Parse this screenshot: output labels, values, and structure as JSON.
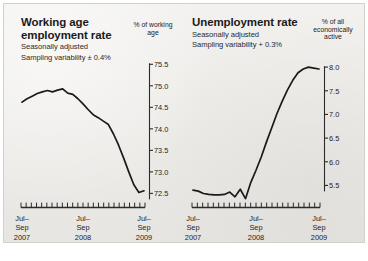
{
  "figure": {
    "background_color": "#eceae6",
    "line_color": "#1a1a1a"
  },
  "chart_data": [
    {
      "type": "line",
      "title": "Working age employment rate",
      "subtitle_1": "Seasonally adjusted",
      "subtitle_2": "Sampling variability ± 0.4%",
      "ylabel": "% of working age",
      "xlabel": "",
      "ylim": [
        72.3,
        75.6
      ],
      "yticks": [
        75.5,
        75.0,
        74.5,
        74.0,
        73.5,
        73.0,
        72.5
      ],
      "ytick_labels": [
        "75.5",
        "75.0",
        "74.5",
        "74.0",
        "73.5",
        "73.0",
        "72.5"
      ],
      "xtick_labels": [
        "Jul–Sep 2007",
        "Jul–Sep 2008",
        "Jul–Sep 2009"
      ],
      "xtick_lines": [
        [
          "Jul–",
          "Sep",
          "2007"
        ],
        [
          "Jul–",
          "Sep",
          "2008"
        ],
        [
          "Jul–",
          "Sep",
          "2009"
        ]
      ],
      "grid": false,
      "legend": "none",
      "n_minor_ticks": 25,
      "x": [
        0,
        1,
        2,
        3,
        4,
        5,
        6,
        7,
        8,
        9,
        10,
        11,
        12,
        13,
        14,
        15,
        16,
        17,
        18,
        19,
        20,
        21,
        22,
        23,
        24
      ],
      "values": [
        74.62,
        74.7,
        74.76,
        74.82,
        74.86,
        74.89,
        74.86,
        74.9,
        74.93,
        74.83,
        74.8,
        74.7,
        74.58,
        74.45,
        74.33,
        74.26,
        74.18,
        74.1,
        73.88,
        73.62,
        73.32,
        73.0,
        72.7,
        72.52,
        72.56
      ]
    },
    {
      "type": "line",
      "title": "Unemployment rate",
      "subtitle_1": "Seasonally adjusted",
      "subtitle_2": "Sampling variability + 0.3%",
      "ylabel": "% of all economically active",
      "xlabel": "",
      "ylim": [
        5.15,
        8.15
      ],
      "yticks": [
        8.0,
        7.5,
        7.0,
        6.5,
        6.0,
        5.5
      ],
      "ytick_labels": [
        "8.0",
        "7.5",
        "7.0",
        "6.5",
        "6.0",
        "5.5"
      ],
      "xtick_labels": [
        "Jul–Sep 2007",
        "Jul–Sep 2008",
        "Jul–Sep 2009"
      ],
      "xtick_lines": [
        [
          "Jul–",
          "Sep",
          "2007"
        ],
        [
          "Jul–",
          "Sep",
          "2008"
        ],
        [
          "Jul–",
          "Sep",
          "2009"
        ]
      ],
      "grid": false,
      "legend": "none",
      "n_minor_ticks": 25,
      "x": [
        0,
        1,
        2,
        3,
        4,
        5,
        6,
        7,
        8,
        9,
        10,
        11,
        12,
        13,
        14,
        15,
        16,
        17,
        18,
        19,
        20,
        21,
        22,
        23,
        24
      ],
      "values": [
        5.4,
        5.38,
        5.33,
        5.31,
        5.3,
        5.3,
        5.31,
        5.36,
        5.26,
        5.42,
        5.22,
        5.56,
        5.82,
        6.1,
        6.42,
        6.72,
        7.02,
        7.28,
        7.52,
        7.72,
        7.88,
        7.96,
        8.0,
        7.98,
        7.96
      ]
    }
  ]
}
